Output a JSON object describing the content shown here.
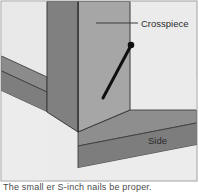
{
  "figure": {
    "background_color": "#ebebeb",
    "border_color": "#9a9a9a"
  },
  "labels": {
    "crosspiece": "Crosspiece",
    "side": "Side"
  },
  "caption": {
    "text": "The small er S-inch nails be proper."
  },
  "colors": {
    "background": "#ebebeb",
    "floor_light": "#ededed",
    "side_board_top": "#8e8e8e",
    "side_board_face": "#7d7d7d",
    "crosspiece_left_face": "#808080",
    "crosspiece_right_face": "#a6a6a6",
    "floor_plane": "#9d9d9d",
    "outline": "#3f3f3f",
    "nail": "#101010",
    "leader": "#3a3a3a",
    "label_text": "#2b2b2b"
  },
  "parts": {
    "nail": {
      "head_x": 131,
      "head_y": 45,
      "tip_x": 103,
      "tip_y": 98,
      "head_radius": 3.2,
      "shaft_width": 3.0
    },
    "leader_line": {
      "x1": 96,
      "y1": 23,
      "x2": 138,
      "y2": 23
    }
  }
}
